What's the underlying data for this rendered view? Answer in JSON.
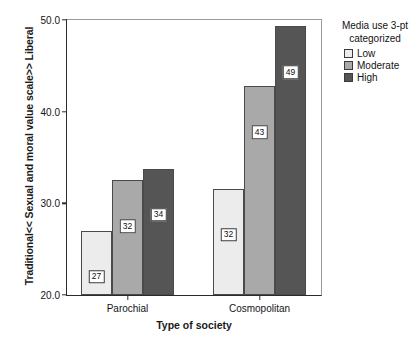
{
  "chart_data": {
    "type": "bar",
    "title": "",
    "xlabel": "Type of society",
    "ylabel": "Traditional<< Sexual and moral value scale>> Liberal",
    "categories": [
      "Parochial",
      "Cosmopolitan"
    ],
    "series": [
      {
        "name": "Low",
        "color": "#ececec",
        "values": [
          27.0,
          31.6
        ],
        "labels": [
          "27",
          "32"
        ]
      },
      {
        "name": "Moderate",
        "color": "#a9a9a9",
        "values": [
          32.5,
          42.8
        ],
        "labels": [
          "32",
          "43"
        ]
      },
      {
        "name": "High",
        "color": "#555555",
        "values": [
          33.8,
          49.3
        ],
        "labels": [
          "34",
          "49"
        ]
      }
    ],
    "ylim": [
      20.0,
      50.0
    ],
    "yticks": [
      "20.0",
      "30.0",
      "40.0",
      "50.0"
    ],
    "ytick_values": [
      20.0,
      30.0,
      40.0,
      50.0
    ],
    "grid": false,
    "legend": {
      "title": "Media use 3-pt categorized",
      "title_line1": "Media use 3-pt",
      "title_line2": "categorized",
      "position": "right",
      "entries": [
        {
          "label": "Low",
          "color": "#ececec"
        },
        {
          "label": "Moderate",
          "color": "#a9a9a9"
        },
        {
          "label": "High",
          "color": "#555555"
        }
      ]
    }
  }
}
